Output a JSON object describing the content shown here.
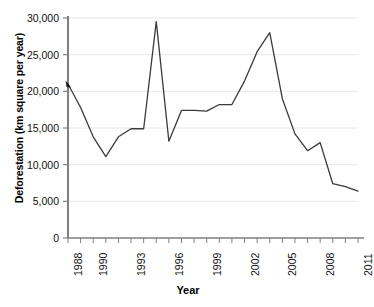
{
  "chart_data": {
    "type": "line",
    "title": "",
    "xlabel": "Year",
    "ylabel": "Deforestation (km square per year)",
    "xlim": [
      1988,
      2011
    ],
    "ylim": [
      0,
      30000
    ],
    "grid": true,
    "legend_position": "none",
    "y_ticks": [
      0,
      5000,
      10000,
      15000,
      20000,
      25000,
      30000
    ],
    "y_tick_labels": [
      "0",
      "5,000",
      "10,000",
      "15,000",
      "20,000",
      "25,000",
      "30,000"
    ],
    "x_ticks": [
      1988,
      1989,
      1990,
      1991,
      1992,
      1993,
      1994,
      1995,
      1996,
      1997,
      1998,
      1999,
      2000,
      2001,
      2002,
      2003,
      2004,
      2005,
      2006,
      2007,
      2008,
      2009,
      2010,
      2011
    ],
    "x_tick_labels": [
      "1988",
      "1990",
      "1993",
      "1996",
      "1999",
      "2002",
      "2005",
      "2008",
      "2011"
    ],
    "labeled_x_ticks": [
      1988,
      1990,
      1993,
      1996,
      1999,
      2002,
      2005,
      2008,
      2011
    ],
    "line_color": "#3a3a3a",
    "grid_color": "#e8e8e8",
    "axis_color": "#808080",
    "x": [
      1988,
      1989,
      1990,
      1991,
      1992,
      1993,
      1994,
      1995,
      1996,
      1997,
      1998,
      1999,
      2000,
      2001,
      2002,
      2003,
      2004,
      2005,
      2006,
      2007,
      2008,
      2009,
      2010,
      2011
    ],
    "values": [
      21000,
      17800,
      13800,
      11100,
      13800,
      14900,
      14900,
      29500,
      13200,
      17400,
      17400,
      17300,
      18200,
      18200,
      21400,
      25400,
      28000,
      19000,
      14200,
      11900,
      13000,
      7400,
      7000,
      6400
    ],
    "series": [
      {
        "name": "Deforestation",
        "values": [
          21000,
          17800,
          13800,
          11100,
          13800,
          14900,
          14900,
          29500,
          13200,
          17400,
          17400,
          17300,
          18200,
          18200,
          21400,
          25400,
          28000,
          19000,
          14200,
          11900,
          13000,
          7400,
          7000,
          6400
        ]
      }
    ],
    "annotations": [
      {
        "name": "start-marker",
        "x": 1988,
        "y": 21000,
        "type": "marker"
      }
    ]
  }
}
